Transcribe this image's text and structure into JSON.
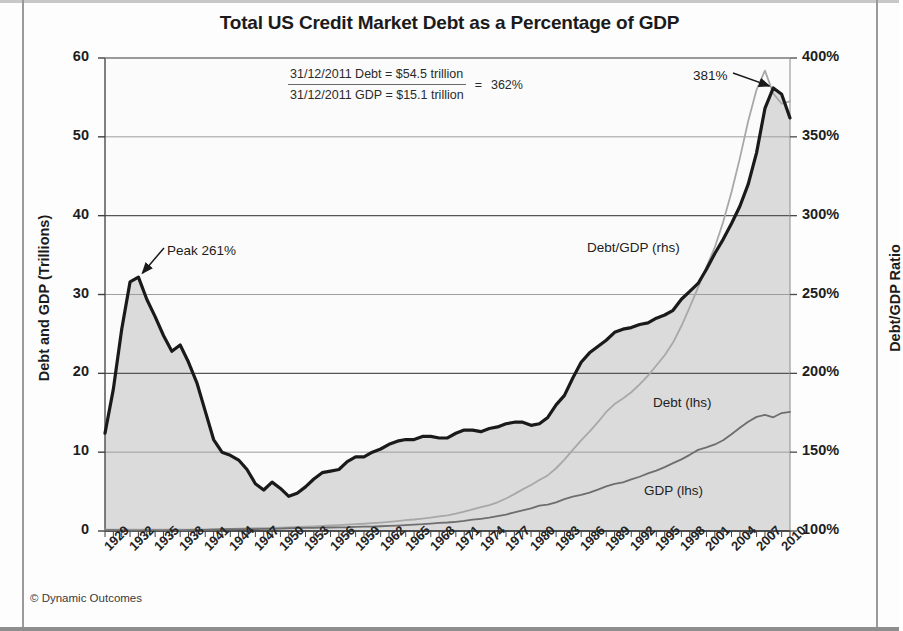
{
  "chart_data": {
    "type": "line",
    "title": "Total US Credit Market Debt as a Percentage of GDP",
    "xlabel": "",
    "ylabel": "Debt and GDP (Trillions)",
    "ylabel_right": "Debt/GDP Ratio",
    "grid": true,
    "legend_position": "inline-annotations",
    "x": [
      1929,
      1930,
      1931,
      1932,
      1933,
      1934,
      1935,
      1936,
      1937,
      1938,
      1939,
      1940,
      1941,
      1942,
      1943,
      1944,
      1945,
      1946,
      1947,
      1948,
      1949,
      1950,
      1951,
      1952,
      1953,
      1954,
      1955,
      1956,
      1957,
      1958,
      1959,
      1960,
      1961,
      1962,
      1963,
      1964,
      1965,
      1966,
      1967,
      1968,
      1969,
      1970,
      1971,
      1972,
      1973,
      1974,
      1975,
      1976,
      1977,
      1978,
      1979,
      1980,
      1981,
      1982,
      1983,
      1984,
      1985,
      1986,
      1987,
      1988,
      1989,
      1990,
      1991,
      1992,
      1993,
      1994,
      1995,
      1996,
      1997,
      1998,
      1999,
      2000,
      2001,
      2002,
      2003,
      2004,
      2005,
      2006,
      2007,
      2008,
      2009,
      2010,
      2011
    ],
    "xticks": [
      "1929",
      "1932",
      "1935",
      "1938",
      "1941",
      "1944",
      "1947",
      "1950",
      "1953",
      "1956",
      "1959",
      "1962",
      "1965",
      "1968",
      "1971",
      "1974",
      "1977",
      "1980",
      "1983",
      "1986",
      "1989",
      "1992",
      "1995",
      "1998",
      "2001",
      "2004",
      "2007",
      "2010"
    ],
    "ylim_left": [
      0,
      60
    ],
    "yticks_left": [
      "0",
      "10",
      "20",
      "30",
      "40",
      "50",
      "60"
    ],
    "ylim_right": [
      100,
      400
    ],
    "yticks_right": [
      "100%",
      "150%",
      "200%",
      "250%",
      "300%",
      "350%",
      "400%"
    ],
    "series": [
      {
        "name": "Debt/GDP (rhs)",
        "axis": "right",
        "color": "#1a1a1a",
        "unit": "%",
        "values": [
          162,
          190,
          228,
          258,
          261,
          247,
          236,
          224,
          214,
          218,
          207,
          194,
          176,
          158,
          150,
          148,
          145,
          139,
          130,
          126,
          131,
          127,
          122,
          124,
          128,
          133,
          137,
          138,
          139,
          144,
          147,
          147,
          150,
          152,
          155,
          157,
          158,
          158,
          160,
          160,
          159,
          159,
          162,
          164,
          164,
          163,
          165,
          166,
          168,
          169,
          169,
          167,
          168,
          172,
          180,
          186,
          197,
          207,
          213,
          217,
          221,
          226,
          228,
          229,
          231,
          232,
          235,
          237,
          240,
          247,
          252,
          257,
          266,
          276,
          285,
          295,
          306,
          320,
          340,
          368,
          381,
          377,
          362
        ]
      },
      {
        "name": "Debt (lhs)",
        "axis": "left",
        "color": "#a8a8a8",
        "unit": "trillion",
        "values": [
          0.17,
          0.17,
          0.17,
          0.17,
          0.16,
          0.16,
          0.16,
          0.17,
          0.17,
          0.17,
          0.18,
          0.19,
          0.2,
          0.22,
          0.25,
          0.28,
          0.31,
          0.33,
          0.35,
          0.37,
          0.39,
          0.43,
          0.47,
          0.51,
          0.55,
          0.59,
          0.65,
          0.7,
          0.74,
          0.8,
          0.87,
          0.92,
          0.99,
          1.07,
          1.16,
          1.26,
          1.37,
          1.46,
          1.58,
          1.71,
          1.85,
          1.97,
          2.19,
          2.45,
          2.74,
          3.02,
          3.29,
          3.64,
          4.12,
          4.68,
          5.28,
          5.84,
          6.46,
          7.05,
          7.96,
          9.05,
          10.3,
          11.5,
          12.6,
          13.8,
          15.1,
          16.1,
          16.8,
          17.6,
          18.6,
          19.7,
          21.0,
          22.3,
          23.9,
          26.0,
          28.4,
          30.9,
          33.5,
          36.0,
          39.2,
          43.0,
          47.3,
          52.0,
          56.0,
          58.4,
          55.5,
          54.2,
          54.5
        ]
      },
      {
        "name": "GDP (lhs)",
        "axis": "left",
        "color": "#6e6e6e",
        "unit": "trillion",
        "values": [
          0.104,
          0.092,
          0.077,
          0.06,
          0.057,
          0.066,
          0.073,
          0.084,
          0.092,
          0.087,
          0.093,
          0.103,
          0.129,
          0.166,
          0.203,
          0.224,
          0.228,
          0.228,
          0.25,
          0.275,
          0.273,
          0.3,
          0.347,
          0.367,
          0.389,
          0.39,
          0.425,
          0.447,
          0.471,
          0.478,
          0.522,
          0.543,
          0.563,
          0.605,
          0.638,
          0.685,
          0.742,
          0.813,
          0.86,
          0.94,
          1.02,
          1.08,
          1.17,
          1.28,
          1.43,
          1.55,
          1.69,
          1.88,
          2.09,
          2.36,
          2.63,
          2.86,
          3.21,
          3.35,
          3.64,
          4.04,
          4.35,
          4.59,
          4.87,
          5.25,
          5.66,
          5.98,
          6.17,
          6.54,
          6.88,
          7.31,
          7.66,
          8.1,
          8.61,
          9.09,
          9.66,
          10.29,
          10.62,
          10.98,
          11.51,
          12.27,
          13.09,
          13.86,
          14.48,
          14.72,
          14.42,
          14.96,
          15.1
        ]
      }
    ],
    "annotations": [
      {
        "id": "peak-1933",
        "text": "Peak 261%",
        "year": 1933,
        "value_pct": 261
      },
      {
        "id": "peak-2009",
        "text": "381%",
        "year": 2009,
        "value_pct": 381
      }
    ]
  },
  "formula": {
    "numerator": "31/12/2011 Debt  =  $54.5 trillion",
    "denominator": "31/12/2011 GDP  =  $15.1 trillion",
    "equals": "=",
    "result": "362%"
  },
  "credit": "© Dynamic Outcomes",
  "colors": {
    "debt_gdp_line": "#1a1a1a",
    "debt_line": "#a8a8a8",
    "gdp_line": "#6e6e6e",
    "plot_fill": "#d6d6d6",
    "grid": "#8a8a8a",
    "axis": "#4a4a4a"
  }
}
